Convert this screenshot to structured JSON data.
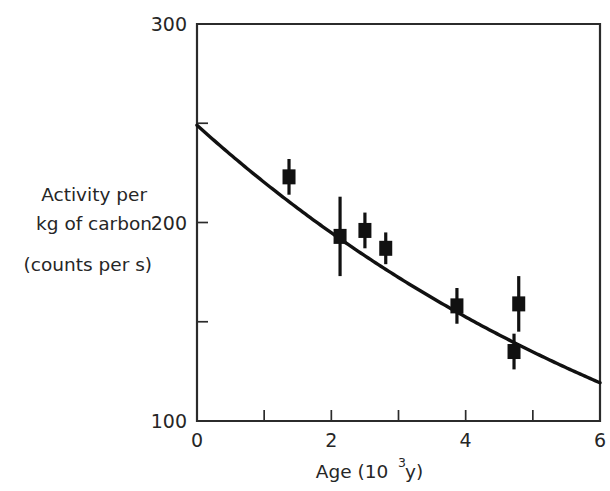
{
  "chart_data": {
    "type": "scatter",
    "title": "",
    "subtitle": "",
    "xlabel": "Age  (10^3 y)",
    "xlabel_parts": {
      "base": "Age  (10",
      "exponent": "3",
      "tail": " y)"
    },
    "ylabel": "Activity per kg of carbon (counts per s)",
    "ylabel_lines": [
      "Activity per",
      "kg of carbon",
      "(counts per s)"
    ],
    "xlim": [
      0,
      6
    ],
    "ylim": [
      100,
      300
    ],
    "xticks": [
      0,
      1,
      2,
      3,
      4,
      5,
      6
    ],
    "xtick_labels": [
      "0",
      "",
      "2",
      "",
      "4",
      "",
      "6"
    ],
    "yticks": [
      100,
      150,
      200,
      250,
      300
    ],
    "ytick_labels": [
      "100",
      "",
      "200",
      "",
      "300"
    ],
    "grid": false,
    "legend": false,
    "legend_position": "none",
    "marker_style": "filled-square",
    "error_bars": "vertical",
    "points": [
      {
        "x": 1.37,
        "y": 223,
        "yerr": 9
      },
      {
        "x": 2.13,
        "y": 193,
        "yerr": 20
      },
      {
        "x": 2.5,
        "y": 196,
        "yerr": 9
      },
      {
        "x": 2.81,
        "y": 187,
        "yerr": 8
      },
      {
        "x": 3.87,
        "y": 158,
        "yerr": 9
      },
      {
        "x": 4.79,
        "y": 159,
        "yerr": 14
      },
      {
        "x": 4.72,
        "y": 135,
        "yerr": 9
      }
    ],
    "fit_curve": {
      "label": "exponential decay fit",
      "description": "A = A0 * exp(-x / tau)",
      "A0": 249,
      "tau": 8.15,
      "x_start": 0,
      "x_end": 6,
      "y_start": 249,
      "y_end": 119
    },
    "colors": {
      "marker": "#111111",
      "curve": "#111111",
      "axis": "#2b2b2b",
      "text": "#262626",
      "background": "#ffffff"
    }
  },
  "figure": {
    "background_color": "#ffffff",
    "plot_area": {
      "left": 197,
      "top": 24,
      "right": 600,
      "bottom": 421
    }
  }
}
